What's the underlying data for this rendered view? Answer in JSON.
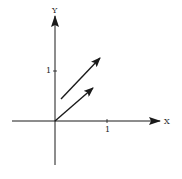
{
  "diagram": {
    "type": "vector-diagram",
    "axes": {
      "x_label": "X",
      "y_label": "Y",
      "x_tick_label": "1",
      "y_tick_label": "1"
    },
    "vectors": [
      {
        "name": "vector-from-origin",
        "from": [
          0,
          0
        ],
        "to": [
          0.72,
          0.66
        ]
      },
      {
        "name": "vector-translated",
        "from": [
          0.12,
          0.44
        ],
        "to": [
          0.86,
          1.26
        ]
      }
    ],
    "colors": {
      "stroke": "#1a1a1a",
      "background": "#ffffff"
    }
  }
}
